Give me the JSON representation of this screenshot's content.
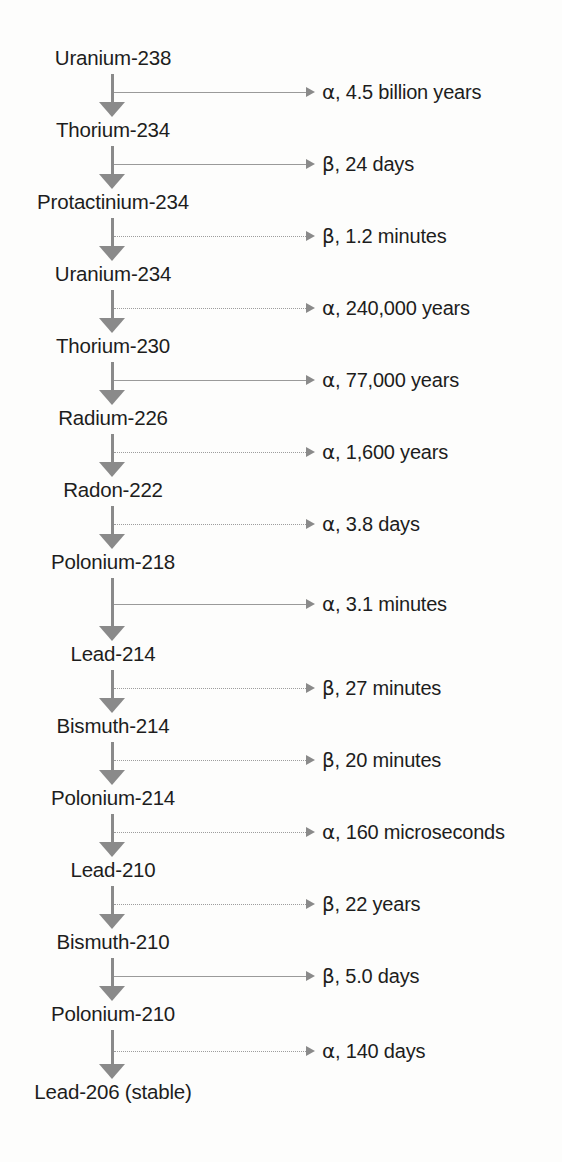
{
  "diagram": {
    "axis_x": 113,
    "colors": {
      "arrow": "#8a8a8a",
      "line": "#9a9a9a",
      "text": "#1d1d1d",
      "background": "#fdfdfc"
    },
    "nuclides": [
      {
        "label": "Uranium-238",
        "y": 48
      },
      {
        "label": "Thorium-234",
        "y": 120
      },
      {
        "label": "Protactinium-234",
        "y": 192
      },
      {
        "label": "Uranium-234",
        "y": 264
      },
      {
        "label": "Thorium-230",
        "y": 336
      },
      {
        "label": "Radium-226",
        "y": 408
      },
      {
        "label": "Radon-222",
        "y": 480
      },
      {
        "label": "Polonium-218",
        "y": 552
      },
      {
        "label": "Lead-214",
        "y": 644
      },
      {
        "label": "Bismuth-214",
        "y": 716
      },
      {
        "label": "Polonium-214",
        "y": 788
      },
      {
        "label": "Lead-210",
        "y": 860
      },
      {
        "label": "Bismuth-210",
        "y": 932
      },
      {
        "label": "Polonium-210",
        "y": 1004
      },
      {
        "label": "Lead-206 (stable)",
        "y": 1082
      }
    ],
    "decays": [
      {
        "particle": "α",
        "halflife": "4.5 billion years",
        "caption": "α, 4.5 billion years",
        "dotted": false
      },
      {
        "particle": "β",
        "halflife": "24 days",
        "caption": "β, 24 days",
        "dotted": false
      },
      {
        "particle": "β",
        "halflife": "1.2 minutes",
        "caption": "β, 1.2 minutes",
        "dotted": true
      },
      {
        "particle": "α",
        "halflife": "240,000 years",
        "caption": "α, 240,000 years",
        "dotted": true
      },
      {
        "particle": "α",
        "halflife": "77,000 years",
        "caption": "α, 77,000 years",
        "dotted": false
      },
      {
        "particle": "α",
        "halflife": "1,600 years",
        "caption": "α, 1,600 years",
        "dotted": true
      },
      {
        "particle": "α",
        "halflife": "3.8 days",
        "caption": "α, 3.8 days",
        "dotted": true
      },
      {
        "particle": "α",
        "halflife": "3.1 minutes",
        "caption": "α, 3.1 minutes",
        "dotted": false
      },
      {
        "particle": "β",
        "halflife": "27 minutes",
        "caption": "β, 27 minutes",
        "dotted": true
      },
      {
        "particle": "β",
        "halflife": "20 minutes",
        "caption": "β, 20 minutes",
        "dotted": true
      },
      {
        "particle": "α",
        "halflife": "160 microseconds",
        "caption": "α, 160 microseconds",
        "dotted": true
      },
      {
        "particle": "β",
        "halflife": "22 years",
        "caption": "β, 22 years",
        "dotted": true
      },
      {
        "particle": "β",
        "halflife": "5.0 days",
        "caption": "β, 5.0 days",
        "dotted": false
      },
      {
        "particle": "α",
        "halflife": "140 days",
        "caption": "α, 140 days",
        "dotted": true
      }
    ]
  }
}
